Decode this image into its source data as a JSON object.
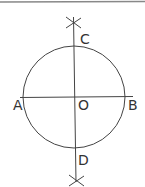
{
  "diagram": {
    "title": "",
    "colors": {
      "line": "#444444",
      "label": "#333333",
      "border": "#888888",
      "background": "#ffffff"
    },
    "circle": {
      "center": "O",
      "cx": 74,
      "cy": 97,
      "r": 51
    },
    "points": [
      {
        "id": "C",
        "label": "C",
        "position": "top of circle"
      },
      {
        "id": "A",
        "label": "A",
        "position": "left of circle"
      },
      {
        "id": "O",
        "label": "O",
        "position": "center"
      },
      {
        "id": "B",
        "label": "B",
        "position": "right of circle"
      },
      {
        "id": "D",
        "label": "D",
        "position": "bottom of circle"
      }
    ],
    "lines": [
      {
        "name": "AB",
        "orientation": "horizontal"
      },
      {
        "name": "CD",
        "orientation": "vertical"
      }
    ],
    "arc_marks": [
      {
        "name": "top-cross",
        "near": "C"
      },
      {
        "name": "bottom-cross",
        "near": "D"
      }
    ]
  }
}
